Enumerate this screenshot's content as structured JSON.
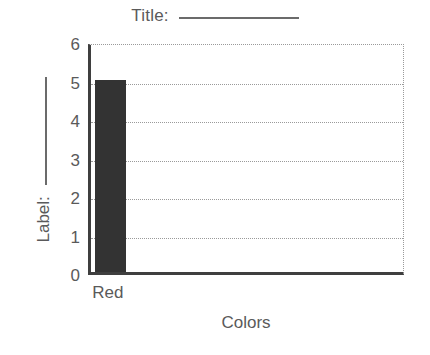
{
  "chart_data": {
    "type": "bar",
    "title": "Title: ",
    "title_has_blank": true,
    "categories": [
      "Red"
    ],
    "values": [
      5
    ],
    "series": [
      {
        "name": "Colors",
        "values": [
          5
        ]
      }
    ],
    "xlabel": "Colors",
    "ylabel": "Label: ",
    "ylabel_has_blank": true,
    "ylim": [
      0,
      6
    ],
    "yticks": [
      6,
      5,
      4,
      3,
      2,
      1,
      0
    ],
    "ytick_labels": [
      "6",
      "5",
      "4",
      "3",
      "2",
      "1",
      "0"
    ],
    "grid": true,
    "grid_style": "dotted",
    "legend": null,
    "bar_color": "#333333",
    "axis_color": "#3f3f3f",
    "grid_color": "#9a9a9a",
    "text_color": "#5a5a5a",
    "background": "#ffffff"
  }
}
